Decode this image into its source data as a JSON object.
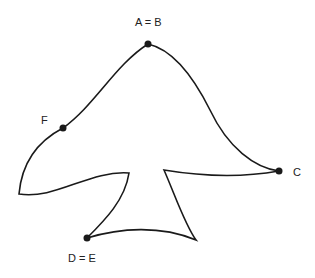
{
  "diagram": {
    "type": "closed curve figure (mushroom-like shape)",
    "stroke_color": "#1a1a1a",
    "points": [
      {
        "id": "AB",
        "label": "A = B",
        "x": 148,
        "y": 44
      },
      {
        "id": "F",
        "label": "F",
        "x": 63,
        "y": 128
      },
      {
        "id": "C",
        "label": "C",
        "x": 279,
        "y": 171
      },
      {
        "id": "DE",
        "label": "D = E",
        "x": 87,
        "y": 238
      }
    ]
  }
}
